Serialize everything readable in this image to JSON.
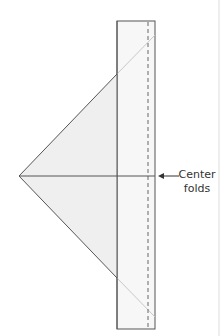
{
  "diagram": {
    "type": "paper-fold-instruction",
    "callout": {
      "line1": "Center",
      "line2": "folds"
    },
    "colors": {
      "outline": "#555555",
      "faint_line": "#c8c8c8",
      "fill_triangle": "#efefef",
      "fill_strip": "#f7f7f7",
      "dash": "#666666",
      "page_edge": "#dddddd",
      "text": "#333333"
    },
    "shapes": {
      "strip": {
        "x": 117,
        "y": 21,
        "width": 38,
        "height": 308
      },
      "fold_line_x": 148,
      "triangle": {
        "apex": [
          19,
          176
        ],
        "top": [
          117,
          74
        ],
        "bottom": [
          117,
          278
        ]
      },
      "center_line_y": 176,
      "arrow": {
        "from": [
          179,
          176
        ],
        "to": [
          158,
          176
        ]
      }
    }
  }
}
